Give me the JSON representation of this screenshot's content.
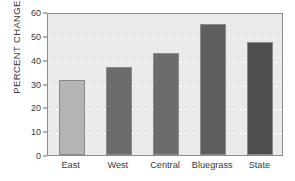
{
  "chart_data": {
    "type": "bar",
    "title": "",
    "subtitle": "",
    "xlabel": "",
    "ylabel": "PERCENT CHANGE",
    "categories": [
      "East",
      "West",
      "Central",
      "Bluegrass",
      "State"
    ],
    "values": [
      31.5,
      37.0,
      43.0,
      55.0,
      47.5
    ],
    "series": [
      {
        "name": "Percent change",
        "values": [
          31.5,
          37.0,
          43.0,
          55.0,
          47.5
        ]
      }
    ],
    "ylim": [
      0,
      60
    ],
    "y_ticks": [
      0,
      10,
      20,
      30,
      40,
      50,
      60
    ],
    "y_tick_labels": [
      "0",
      "10",
      "20",
      "30",
      "40",
      "50",
      "60"
    ],
    "grid": true,
    "grid_axis": "y",
    "legend": false,
    "legend_position": "none",
    "bar_colors": [
      "#b4b4b4",
      "#6c6c6c",
      "#6c6c6c",
      "#5f5f5f",
      "#4f4f4f"
    ],
    "bar_edge_color": "#8a8a8a",
    "plot_background": "#eaeaea",
    "figure_background": "#ffffff",
    "axis_color": "#8d8d8d",
    "gridline_color": "#fdfdfd",
    "text_color": "#3a3a3a"
  }
}
